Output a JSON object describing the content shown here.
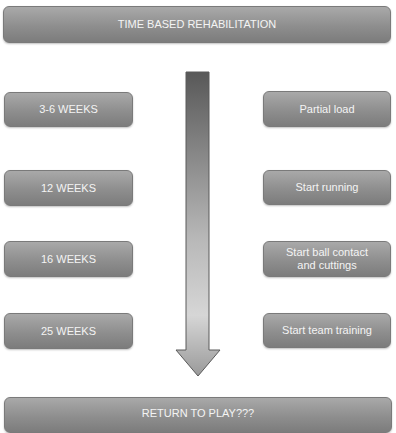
{
  "diagram": {
    "title": "TIME BASED REHABILITATION",
    "footer": "RETURN TO PLAY???",
    "milestones": [
      {
        "time": "3-6 WEEKS",
        "activity": "Partial load"
      },
      {
        "time": "12 WEEKS",
        "activity": "Start running"
      },
      {
        "time": "16 WEEKS",
        "activity": "Start ball contact and cuttings"
      },
      {
        "time": "25 WEEKS",
        "activity": "Start team training"
      }
    ],
    "arrow": {
      "direction": "down",
      "gradient_top": "#555555",
      "gradient_bottom": "#d8d8d8"
    }
  }
}
